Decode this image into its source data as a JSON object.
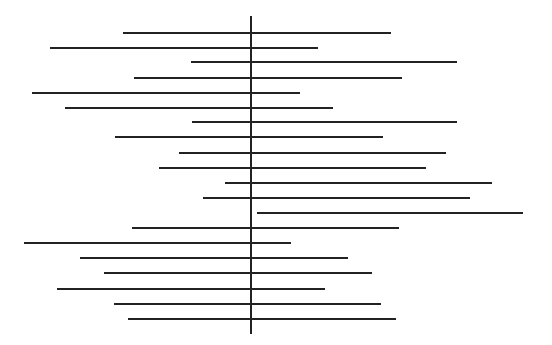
{
  "chart_data": {
    "type": "forest",
    "title": "",
    "xlabel": "",
    "ylabel": "",
    "grid": false,
    "legend": null,
    "reference_line": {
      "x_px": 251,
      "y_top_px": 16,
      "y_bottom_px": 334
    },
    "line_color": "#222222",
    "background": "#ffffff",
    "intervals": [
      {
        "y": 33,
        "x_start": 123,
        "x_end": 391
      },
      {
        "y": 48,
        "x_start": 50,
        "x_end": 318
      },
      {
        "y": 62,
        "x_start": 191,
        "x_end": 457
      },
      {
        "y": 78,
        "x_start": 134,
        "x_end": 402
      },
      {
        "y": 93,
        "x_start": 32,
        "x_end": 300
      },
      {
        "y": 108,
        "x_start": 65,
        "x_end": 333
      },
      {
        "y": 122,
        "x_start": 192,
        "x_end": 457
      },
      {
        "y": 137,
        "x_start": 115,
        "x_end": 383
      },
      {
        "y": 153,
        "x_start": 179,
        "x_end": 446
      },
      {
        "y": 168,
        "x_start": 159,
        "x_end": 426
      },
      {
        "y": 183,
        "x_start": 225,
        "x_end": 492
      },
      {
        "y": 198,
        "x_start": 203,
        "x_end": 470
      },
      {
        "y": 213,
        "x_start": 257,
        "x_end": 523
      },
      {
        "y": 228,
        "x_start": 132,
        "x_end": 399
      },
      {
        "y": 243,
        "x_start": 24,
        "x_end": 291
      },
      {
        "y": 258,
        "x_start": 80,
        "x_end": 348
      },
      {
        "y": 273,
        "x_start": 104,
        "x_end": 372
      },
      {
        "y": 289,
        "x_start": 57,
        "x_end": 325
      },
      {
        "y": 304,
        "x_start": 114,
        "x_end": 381
      },
      {
        "y": 319,
        "x_start": 128,
        "x_end": 396
      }
    ]
  }
}
